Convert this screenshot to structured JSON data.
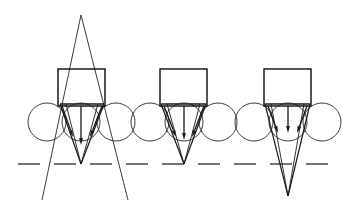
{
  "figure": {
    "background_color": "#ffffff",
    "stroke_color": "#1a1a1a",
    "thin_stroke_color": "#3a3a3a",
    "canvas": {
      "width": 343,
      "height": 216
    }
  },
  "reference_line": {
    "name": "focal-plane-dashed-line",
    "y": 164,
    "x_start": 18,
    "x_end": 330,
    "dash_length": 22,
    "gap_length": 14,
    "stroke_width": 1.4,
    "color": "#3a3a3a"
  },
  "diagrams": [
    {
      "id": "diagram-1",
      "label": "left-diagram",
      "aperture": {
        "name": "aperture-rectangle",
        "x": 58,
        "y": 69,
        "width": 47,
        "height": 37,
        "stroke_width": 1.5
      },
      "circles": [
        {
          "name": "lens-circle-left",
          "cx": 47,
          "cy": 122,
          "r": 19
        },
        {
          "name": "lens-circle-center",
          "cx": 81,
          "cy": 122,
          "r": 19
        },
        {
          "name": "lens-circle-right",
          "cx": 116,
          "cy": 122,
          "r": 19
        }
      ],
      "cone": {
        "name": "convergence-cone",
        "left_x": 60,
        "right_x": 104,
        "top_y": 104,
        "apex_x": 81,
        "apex_y": 164
      },
      "long_rays": {
        "name": "crossing-rays",
        "apex_x": 81,
        "apex_y": 15,
        "left_end_x": 42,
        "left_end_y": 200,
        "right_end_x": 128,
        "right_end_y": 200,
        "cross_left_x": 60,
        "cross_y": 104,
        "cross_right_x": 104
      },
      "arrows": [
        {
          "name": "ray-arrow-left",
          "x1": 62,
          "y1": 106,
          "x2": 73,
          "y2": 137,
          "head": 7
        },
        {
          "name": "ray-arrow-center",
          "x1": 81,
          "y1": 106,
          "x2": 81,
          "y2": 145,
          "head": 7
        },
        {
          "name": "ray-arrow-right",
          "x1": 102,
          "y1": 106,
          "x2": 90,
          "y2": 137,
          "head": 7
        }
      ]
    },
    {
      "id": "diagram-2",
      "label": "center-diagram",
      "aperture": {
        "name": "aperture-rectangle",
        "x": 160,
        "y": 69,
        "width": 47,
        "height": 37,
        "stroke_width": 1.5
      },
      "circles": [
        {
          "name": "lens-circle-left",
          "cx": 150,
          "cy": 122,
          "r": 19
        },
        {
          "name": "lens-circle-center",
          "cx": 184,
          "cy": 122,
          "r": 19
        },
        {
          "name": "lens-circle-right",
          "cx": 218,
          "cy": 122,
          "r": 19
        }
      ],
      "cone": {
        "name": "convergence-cone",
        "left_x": 161,
        "right_x": 206,
        "top_y": 104,
        "apex_x": 184,
        "apex_y": 164
      },
      "arrows": [
        {
          "name": "ray-arrow-left",
          "x1": 164,
          "y1": 106,
          "x2": 176,
          "y2": 137,
          "head": 7
        },
        {
          "name": "ray-arrow-center",
          "x1": 184,
          "y1": 106,
          "x2": 184,
          "y2": 140,
          "head": 7
        },
        {
          "name": "ray-arrow-right",
          "x1": 204,
          "y1": 106,
          "x2": 192,
          "y2": 137,
          "head": 7
        }
      ]
    },
    {
      "id": "diagram-3",
      "label": "right-diagram",
      "aperture": {
        "name": "aperture-rectangle",
        "x": 264,
        "y": 69,
        "width": 47,
        "height": 37,
        "stroke_width": 1.5
      },
      "circles": [
        {
          "name": "lens-circle-left",
          "cx": 254,
          "cy": 122,
          "r": 19
        },
        {
          "name": "lens-circle-center",
          "cx": 288,
          "cy": 122,
          "r": 19
        },
        {
          "name": "lens-circle-right",
          "cx": 322,
          "cy": 122,
          "r": 19
        }
      ],
      "cone": {
        "name": "convergence-cone",
        "left_x": 265,
        "right_x": 310,
        "top_y": 104,
        "apex_x": 288,
        "apex_y": 196
      },
      "arrows": [
        {
          "name": "ray-arrow-left",
          "x1": 268,
          "y1": 106,
          "x2": 278,
          "y2": 133,
          "head": 7
        },
        {
          "name": "ray-arrow-center",
          "x1": 288,
          "y1": 106,
          "x2": 288,
          "y2": 133,
          "head": 7
        },
        {
          "name": "ray-arrow-right",
          "x1": 307,
          "y1": 106,
          "x2": 297,
          "y2": 133,
          "head": 7
        }
      ]
    }
  ]
}
